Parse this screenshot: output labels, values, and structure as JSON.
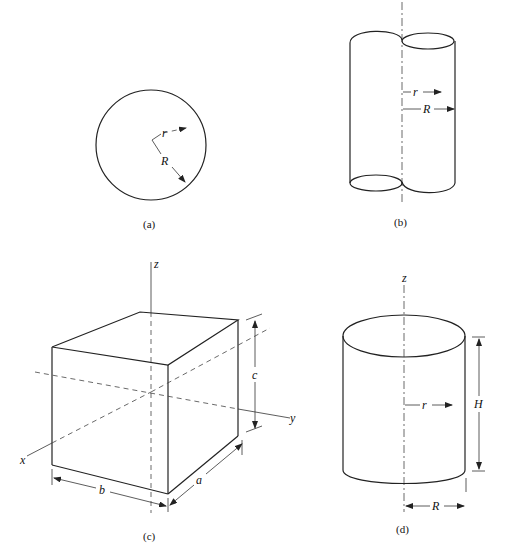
{
  "figures": {
    "a": {
      "caption": "(a)",
      "description": "Circle (sphere cross-section)",
      "labels": {
        "small_radius": "r",
        "large_radius": "R"
      }
    },
    "b": {
      "caption": "(b)",
      "description": "Cylinder with axis on its side (half-cylinder about axis)",
      "labels": {
        "small_radius": "r",
        "large_radius": "R"
      }
    },
    "c": {
      "caption": "(c)",
      "description": "Rectangular block with x, y, z axes",
      "labels": {
        "z_axis": "z",
        "x_axis": "x",
        "y_axis": "y",
        "dim_a": "a",
        "dim_b": "b",
        "dim_c": "c"
      }
    },
    "d": {
      "caption": "(d)",
      "description": "Upright cylinder about z axis",
      "labels": {
        "z_axis": "z",
        "radius_r": "r",
        "height": "H",
        "radius_R": "R"
      }
    }
  }
}
